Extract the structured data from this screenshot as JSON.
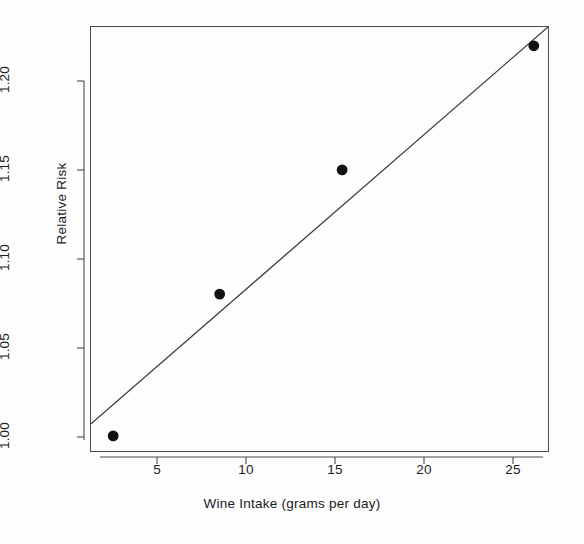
{
  "chart_data": {
    "type": "scatter",
    "title": "",
    "subtitle": "",
    "xlabel": "Wine Intake (grams per day)",
    "ylabel": "Relative Risk",
    "xlim": [
      1.25,
      27.0
    ],
    "ylim": [
      0.9915,
      1.2306
    ],
    "xticks": [
      5,
      10,
      15,
      20,
      25
    ],
    "xticklabels": [
      "5",
      "10",
      "15",
      "20",
      "25"
    ],
    "yticks": [
      1.0,
      1.05,
      1.1,
      1.15,
      1.2
    ],
    "yticklabels": [
      "1.00",
      "1.05",
      "1.10",
      "1.15",
      "1.20"
    ],
    "grid": false,
    "legend": null,
    "legend_position": "none",
    "marker": "filled-circle",
    "marker_color": "#111111",
    "line_color": "#3b3b3b",
    "frame_color": "#4a4a4a",
    "background": "#fdfdfd",
    "points": [
      {
        "x": 2.5,
        "y": 1.0
      },
      {
        "x": 8.5,
        "y": 1.08
      },
      {
        "x": 15.4,
        "y": 1.15
      },
      {
        "x": 26.2,
        "y": 1.22
      }
    ],
    "series": [
      {
        "name": "Observed relative risk",
        "type": "scatter",
        "x": [
          2.5,
          8.5,
          15.4,
          26.2
        ],
        "values": [
          1.0,
          1.08,
          1.15,
          1.22
        ]
      },
      {
        "name": "Fitted dose-response line",
        "type": "line",
        "x": [
          1.25,
          27.0
        ],
        "values": [
          1.0068,
          1.2306
        ]
      }
    ],
    "fit_line": {
      "x_start": 1.25,
      "y_start": 1.0068,
      "x_end": 27.0,
      "y_end": 1.2306
    }
  },
  "axes": {
    "x_title": "Wine Intake (grams per day)",
    "y_title": "Relative Risk",
    "x_tick_labels": [
      "5",
      "10",
      "15",
      "20",
      "25"
    ],
    "y_tick_labels": [
      "1.00",
      "1.05",
      "1.10",
      "1.15",
      "1.20"
    ]
  }
}
